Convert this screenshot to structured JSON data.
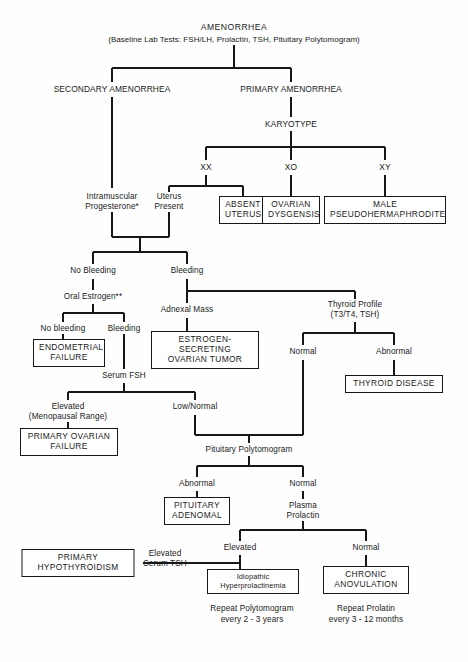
{
  "figure": {
    "type": "flowchart",
    "root": "AMENORRHEA",
    "root_subtitle": "(Baseline Lab Tests:  FSH/LH, Prolactin, TSH, Pituitary Polytomogram)"
  },
  "nodes": {
    "root_title": "AMENORRHEA",
    "root_tests": "(Baseline Lab Tests:  FSH/LH, Prolactin, TSH, Pituitary Polytomogram)",
    "secondary_amenorrhea": "SECONDARY AMENORRHEA",
    "primary_amenorrhea": "PRIMARY AMENORRHEA",
    "karyotype": "KARYOTYPE",
    "xx": "XX",
    "xo": "XO",
    "xy": "XY",
    "uterus_present": "Uterus\nPresent",
    "absent_uterus": "ABSENT\nUTERUS",
    "ovarian_dysgensis": "OVARIAN\nDYSGENSIS",
    "male_pseudohermaphrodite": "MALE\nPSEUDOHERMAPHRODITE",
    "intramuscular_progesterone": "Intramuscular\nProgesterone*",
    "no_bleeding_1": "No Bleeding",
    "bleeding_1": "Bleeding",
    "oral_estrogen": "Oral Estrogen**",
    "no_bleeding_2": "No bleeding",
    "bleeding_2": "Bleeding",
    "endometrial_failure": "ENDOMETRIAL\nFAILURE",
    "adnexal_mass": "Adnexal Mass",
    "estrogen_secreting_ovarian_tumor": "ESTROGEN-SECRETING\nOVARIAN TUMOR",
    "thyroid_profile": "Thyroid Profile\n(T3/T4, TSH)",
    "thyroid_normal": "Normal",
    "thyroid_abnormal": "Abnormal",
    "thyroid_disease": "THYROID DISEASE",
    "serum_fsh": "Serum FSH",
    "fsh_elevated": "Elevated\n(Menopausal Range)",
    "fsh_low_normal": "Low/Normal",
    "primary_ovarian_failure": "PRIMARY OVARIAN\nFAILURE",
    "pituitary_polytomogram": "Pituitary Polytomogram",
    "pituitary_abnormal": "Abnormal",
    "pituitary_normal": "Normal",
    "pituitary_adenomal": "PITUITARY\nADENOMAL",
    "plasma_prolactin": "Plasma\nProlactin",
    "prolactin_elevated": "Elevated",
    "prolactin_normal": "Normal",
    "primary_hypothyroidism": "PRIMARY\nHYPOTHYROIDISM",
    "elevated_serum_tsh": "Elevated\nSerum TSH",
    "idiopathic_hyperprolactinemia": "Idiopathic\nHyperprolactinemia",
    "chronic_anovulation": "CHRONIC\nANOVULATION",
    "repeat_polytomogram": "Repeat Polytomogram\nevery 2 - 3 years",
    "repeat_prolactin": "Repeat Prolatin\nevery 3 - 12 months"
  }
}
